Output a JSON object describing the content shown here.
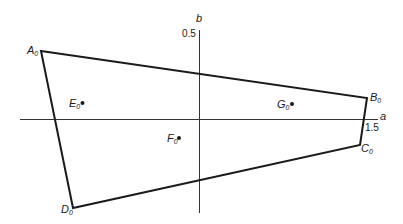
{
  "diagram": {
    "axes": {
      "horizontal": {
        "label": "a",
        "tick_label": "1.5"
      },
      "vertical": {
        "label": "b",
        "tick_label": "0.5"
      }
    },
    "polygon": {
      "vertices": [
        {
          "name": "A",
          "subscript": "0"
        },
        {
          "name": "B",
          "subscript": "0"
        },
        {
          "name": "C",
          "subscript": "0"
        },
        {
          "name": "D",
          "subscript": "0"
        }
      ]
    },
    "points": [
      {
        "name": "E",
        "subscript": "0"
      },
      {
        "name": "F",
        "subscript": "0"
      },
      {
        "name": "G",
        "subscript": "0"
      }
    ],
    "colors": {
      "line": "#1a1a1a",
      "axis": "#333333",
      "background": "#ffffff"
    }
  }
}
